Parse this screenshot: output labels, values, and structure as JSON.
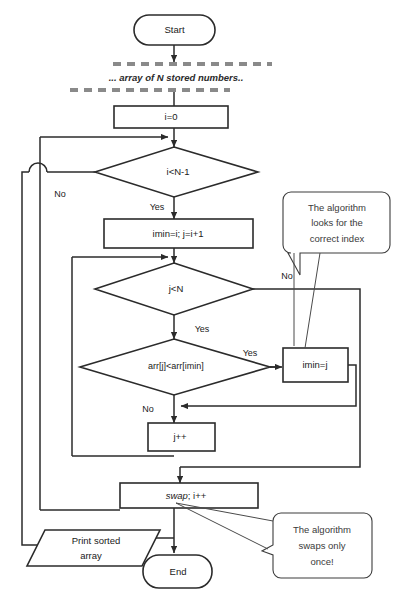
{
  "diagram": {
    "colors": {
      "stroke": "#2b2b2b",
      "text": "#1a1a1a",
      "dashed_comment": "#8a8a8a",
      "callout_text": "#3a3a3a",
      "background": "#ffffff"
    },
    "nodes": {
      "start": "Start",
      "comment": "... array of N stored numbers..",
      "init_i": "i=0",
      "cond_outer": "i<N-1",
      "init_inner": "imin=i; j=i+1",
      "cond_inner": "j<N",
      "cond_compare": "arr[j]<arr[imin]",
      "assign_imin": "imin=j",
      "incr_j": "j++",
      "swap_italic": "swap",
      "swap_rest": "; i++",
      "print": "Print sorted array",
      "print_line1": "Print sorted",
      "print_line2": "array",
      "end": "End"
    },
    "edge_labels": {
      "outer_no": "No",
      "outer_yes": "Yes",
      "inner_no": "No",
      "inner_yes": "Yes",
      "compare_yes": "Yes",
      "compare_no": "No"
    },
    "callouts": [
      {
        "id": "callout-correct-index",
        "line1": "The algorithm",
        "line2": "looks for the",
        "line3": "correct index"
      },
      {
        "id": "callout-swaps-once",
        "line1": "The algorithm",
        "line2": "swaps only",
        "line3": "once!"
      }
    ]
  }
}
